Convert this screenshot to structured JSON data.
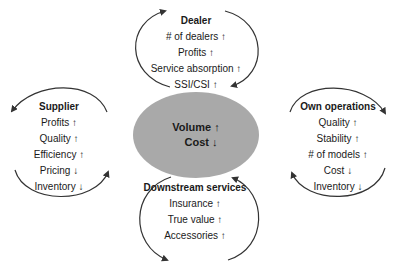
{
  "center": {
    "line1": "Volume ↑",
    "line2": "Cost ↓",
    "fill_color": "#a9a9a9"
  },
  "blocks": {
    "dealer": {
      "title": "Dealer",
      "items": [
        "# of dealers ↑",
        "Profits ↑",
        "Service absorption ↑",
        "SSI/CSI ↑"
      ]
    },
    "supplier": {
      "title": "Supplier",
      "items": [
        "Profits ↑",
        "Quality ↑",
        "Efficiency ↑",
        "Pricing ↓",
        "Inventory ↓"
      ]
    },
    "own_operations": {
      "title": "Own operations",
      "items": [
        "Quality ↑",
        "Stability ↑",
        "# of models ↑",
        "Cost ↓",
        "Inventory ↓"
      ]
    },
    "downstream": {
      "title": "Downstream services",
      "items": [
        "Insurance ↑",
        "True value ↑",
        "Accessories ↑"
      ]
    }
  },
  "arrow_color": "#333333"
}
